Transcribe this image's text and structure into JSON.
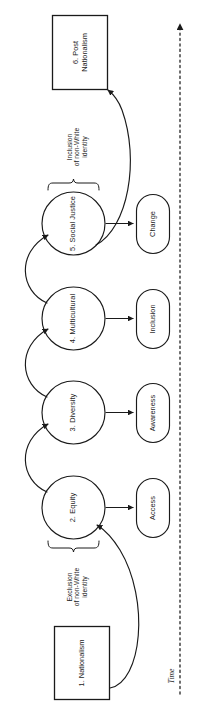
{
  "figure": {
    "type": "process-flow-diagram",
    "orientation": "rotated-90-counterclockwise",
    "stroke_color": "#1a1a1a",
    "fill_color": "#ffffff",
    "background": "#ffffff"
  },
  "stages": [
    {
      "id": "stage-1",
      "label": "1. Nationalism",
      "shape": "rectangle"
    },
    {
      "id": "stage-2",
      "label": "2. Equity",
      "shape": "circle",
      "outcome": "Access"
    },
    {
      "id": "stage-3",
      "label": "3. Diversity",
      "shape": "circle",
      "outcome": "Awareness"
    },
    {
      "id": "stage-4",
      "label": "4. Multicultural",
      "shape": "circle",
      "outcome": "Inclusion"
    },
    {
      "id": "stage-5",
      "label": "5. Social Justice",
      "shape": "circle",
      "outcome": "Change"
    },
    {
      "id": "stage-6",
      "label": "6. Post\nNationalism",
      "shape": "rectangle"
    }
  ],
  "outcomes": [
    {
      "id": "outcome-access",
      "label": "Access"
    },
    {
      "id": "outcome-awareness",
      "label": "Awareness"
    },
    {
      "id": "outcome-inclusion",
      "label": "Inclusion"
    },
    {
      "id": "outcome-change",
      "label": "Change"
    }
  ],
  "braces": [
    {
      "id": "brace-exclusion",
      "label": "Exclusion\nof non-White\nidentity",
      "points_to": "2. Equity"
    },
    {
      "id": "brace-inclusion",
      "label": "Inclusion\nof non-White\nidentity",
      "points_to": "5. Social Justice"
    }
  ],
  "axis": {
    "label": "Time",
    "style": "dashed-arrow",
    "direction": "upward"
  }
}
